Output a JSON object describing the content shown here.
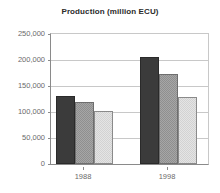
{
  "chart_data": {
    "type": "bar",
    "title": "Production (million ECU)",
    "xlabel": "",
    "ylabel": "",
    "categories": [
      "1988",
      "1998"
    ],
    "series": [
      {
        "name": "series-1",
        "color": "#3b3b3b",
        "values": [
          131000,
          206000
        ]
      },
      {
        "name": "series-2",
        "color": "#9a9a9a",
        "values": [
          119000,
          173000
        ]
      },
      {
        "name": "series-3",
        "color": "#dadada",
        "values": [
          102000,
          129000
        ]
      }
    ],
    "ylim": [
      0,
      250000
    ],
    "ytick_values": [
      0,
      50000,
      100000,
      150000,
      200000,
      250000
    ],
    "ytick_labels": [
      "0",
      "50,000",
      "100,000",
      "150,000",
      "200,000",
      "250,000"
    ],
    "grid": true,
    "legend": "none"
  }
}
